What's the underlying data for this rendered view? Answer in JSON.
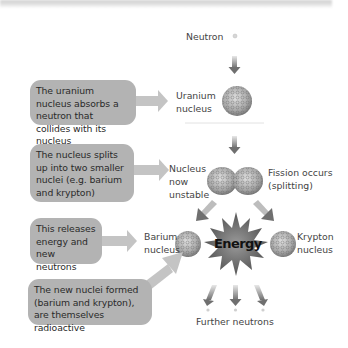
{
  "colors": {
    "box_fill": "#b3b3b3",
    "arrow_fill": "#c4c4c4",
    "down_arrow": "#7a7a7a",
    "energy_burst": "#6e6e6e",
    "text": "#3a3a3a"
  },
  "left_boxes": [
    {
      "text": "The uranium nucleus absorbs a neutron that collides with its nucleus"
    },
    {
      "text": "The nucleus splits up into two smaller nuclei (e.g. barium and krypton)"
    },
    {
      "text": "This releases energy and new neutrons"
    },
    {
      "text": "The new nuclei formed (barium and krypton), are themselves radioactive"
    }
  ],
  "labels": {
    "neutron": "Neutron",
    "uranium_1": "Uranium",
    "uranium_2": "nucleus",
    "unstable_1": "Nucleus",
    "unstable_2": "now",
    "unstable_3": "unstable",
    "fission_1": "Fission occurs",
    "fission_2": "(splitting)",
    "barium_1": "Barium",
    "barium_2": "nucleus",
    "krypton_1": "Krypton",
    "krypton_2": "nucleus",
    "energy": "Energy",
    "further_neutrons": "Further neutrons"
  },
  "icons": {
    "neutron": "small-gray-dot",
    "nucleus": "cluster-sphere",
    "energy": "starburst"
  }
}
